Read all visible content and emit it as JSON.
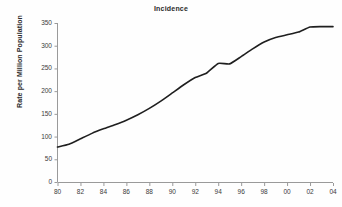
{
  "chart_data": {
    "type": "line",
    "title": "Incidence",
    "xlabel": "",
    "ylabel": "Rate per Million Population",
    "ylim": [
      0,
      350
    ],
    "xlim": [
      1980,
      2004
    ],
    "yticks": [
      0,
      50,
      100,
      150,
      200,
      250,
      300,
      350
    ],
    "ytick_labels": [
      "0",
      "50",
      "100",
      "150",
      "200",
      "250",
      "300",
      "350"
    ],
    "xticks": [
      1980,
      1982,
      1984,
      1986,
      1988,
      1990,
      1992,
      1994,
      1996,
      1998,
      2000,
      2002,
      2004
    ],
    "xtick_labels": [
      "80",
      "82",
      "84",
      "86",
      "88",
      "90",
      "92",
      "94",
      "96",
      "98",
      "00",
      "02",
      "04"
    ],
    "grid": false,
    "legend": false,
    "legend_position": "none",
    "line_color": "#1f1f1f",
    "axis_color": "#9a9a9a",
    "series": [
      {
        "name": "Incidence",
        "x": [
          1980,
          1981,
          1982,
          1983,
          1984,
          1985,
          1986,
          1987,
          1988,
          1989,
          1990,
          1991,
          1992,
          1993,
          1994,
          1995,
          1996,
          1997,
          1998,
          1999,
          2000,
          2001,
          2002,
          2003,
          2004
        ],
        "values": [
          77,
          83,
          95,
          107,
          117,
          126,
          136,
          148,
          162,
          178,
          196,
          214,
          230,
          240,
          261,
          260,
          276,
          293,
          308,
          318,
          324,
          330,
          341,
          342,
          342
        ]
      }
    ]
  }
}
